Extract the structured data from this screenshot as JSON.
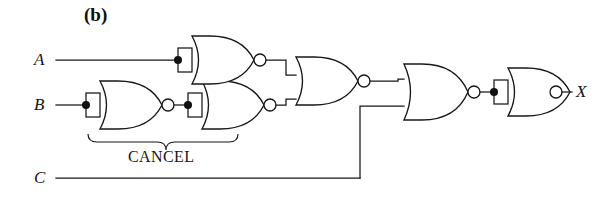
{
  "figure": {
    "panel_label": "(b)",
    "caption_bracket_label": "CANCEL",
    "background": "#ffffff",
    "ink_color": "#171717",
    "inputs": [
      {
        "name": "A",
        "label": "A",
        "y": 60
      },
      {
        "name": "B",
        "label": "B",
        "y": 105
      },
      {
        "name": "C",
        "label": "C",
        "y": 178
      }
    ],
    "outputs": [
      {
        "name": "X",
        "label": "X",
        "y": 92
      }
    ],
    "gates": [
      {
        "id": "g1",
        "type": "NOR",
        "role": "inverter",
        "inputs": [
          "A"
        ],
        "tied_inputs": true,
        "label": "nor-gate-a-inverter"
      },
      {
        "id": "g2",
        "type": "NOR",
        "role": "inverter",
        "inputs": [
          "B"
        ],
        "tied_inputs": true,
        "label": "nor-gate-b-inverter"
      },
      {
        "id": "g3",
        "type": "NOR",
        "role": "inverter",
        "inputs": [
          "g2"
        ],
        "tied_inputs": true,
        "label": "nor-gate-cancel-second"
      },
      {
        "id": "g4",
        "type": "NOR",
        "role": "combiner",
        "inputs": [
          "g1",
          "g3"
        ],
        "tied_inputs": false,
        "label": "nor-gate-merge"
      },
      {
        "id": "g5",
        "type": "NOR",
        "role": "combiner",
        "inputs": [
          "g4",
          "C"
        ],
        "tied_inputs": false,
        "label": "nor-gate-with-c"
      },
      {
        "id": "g6",
        "type": "NOR",
        "role": "inverter",
        "inputs": [
          "g5"
        ],
        "tied_inputs": true,
        "label": "nor-gate-output-inverter"
      }
    ],
    "bracket": {
      "label": "CANCEL",
      "covers": [
        "g2",
        "g3"
      ]
    }
  }
}
